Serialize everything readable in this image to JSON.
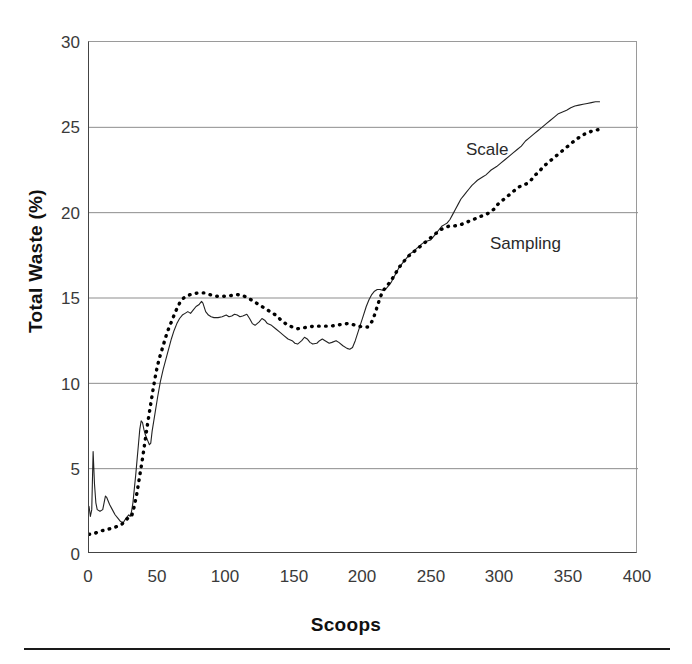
{
  "figure": {
    "background_color": "#ffffff",
    "frame_color": "#444444",
    "gridline_color": "#8d8d8d",
    "scale_series_color": "#222222",
    "sampling_series_color": "#000000"
  },
  "annotations": {
    "scale_label": "Scale",
    "sampling_label": "Sampling"
  },
  "axis": {
    "y_title": "Total Waste (%)",
    "x_title": "Scoops",
    "y_ticks": [
      "0",
      "5",
      "10",
      "15",
      "20",
      "25",
      "30"
    ],
    "x_ticks": [
      "0",
      "50",
      "100",
      "150",
      "200",
      "250",
      "300",
      "350",
      "400"
    ]
  },
  "chart_data": {
    "type": "line",
    "title": "",
    "subtitle": "",
    "xlabel": "Scoops",
    "ylabel": "Total Waste (%)",
    "xlim": [
      0,
      400
    ],
    "ylim": [
      0,
      30
    ],
    "x_ticks": [
      0,
      50,
      100,
      150,
      200,
      250,
      300,
      350,
      400
    ],
    "y_ticks": [
      0,
      5,
      10,
      15,
      20,
      25,
      30
    ],
    "grid": "horizontal",
    "legend_position": "inline-annotations",
    "series": [
      {
        "name": "Scale",
        "style": "solid-thin",
        "color": "#222222",
        "annotation_at": {
          "x": 283,
          "y": 23.6
        },
        "points": [
          [
            0,
            2.8
          ],
          [
            1,
            2.2
          ],
          [
            2,
            2.6
          ],
          [
            3,
            6.0
          ],
          [
            4,
            4.1
          ],
          [
            5,
            3.0
          ],
          [
            6,
            2.6
          ],
          [
            8,
            2.5
          ],
          [
            10,
            2.6
          ],
          [
            12,
            3.4
          ],
          [
            13,
            3.3
          ],
          [
            15,
            2.9
          ],
          [
            17,
            2.6
          ],
          [
            19,
            2.3
          ],
          [
            21,
            2.1
          ],
          [
            23,
            1.9
          ],
          [
            25,
            1.85
          ],
          [
            27,
            2.1
          ],
          [
            29,
            2.3
          ],
          [
            30,
            2.2
          ],
          [
            31,
            2.5
          ],
          [
            32,
            3.0
          ],
          [
            33,
            3.8
          ],
          [
            34,
            4.6
          ],
          [
            35,
            5.5
          ],
          [
            36,
            6.4
          ],
          [
            37,
            7.3
          ],
          [
            38,
            7.8
          ],
          [
            39,
            7.7
          ],
          [
            40,
            7.3
          ],
          [
            41,
            7.0
          ],
          [
            42,
            6.8
          ],
          [
            43,
            6.6
          ],
          [
            44,
            6.4
          ],
          [
            45,
            6.5
          ],
          [
            46,
            7.2
          ],
          [
            48,
            8.2
          ],
          [
            50,
            9.2
          ],
          [
            52,
            10.1
          ],
          [
            54,
            10.8
          ],
          [
            56,
            11.4
          ],
          [
            58,
            12.0
          ],
          [
            60,
            12.6
          ],
          [
            62,
            13.1
          ],
          [
            64,
            13.5
          ],
          [
            66,
            13.8
          ],
          [
            68,
            14.0
          ],
          [
            70,
            14.1
          ],
          [
            72,
            14.2
          ],
          [
            74,
            14.1
          ],
          [
            76,
            14.3
          ],
          [
            78,
            14.5
          ],
          [
            80,
            14.6
          ],
          [
            82,
            14.8
          ],
          [
            83,
            14.7
          ],
          [
            85,
            14.2
          ],
          [
            87,
            14.0
          ],
          [
            89,
            13.9
          ],
          [
            91,
            13.85
          ],
          [
            94,
            13.85
          ],
          [
            97,
            13.9
          ],
          [
            100,
            14.0
          ],
          [
            102,
            13.9
          ],
          [
            104,
            13.95
          ],
          [
            106,
            14.05
          ],
          [
            108,
            14.0
          ],
          [
            110,
            13.9
          ],
          [
            112,
            13.95
          ],
          [
            115,
            14.05
          ],
          [
            117,
            13.8
          ],
          [
            119,
            13.5
          ],
          [
            121,
            13.4
          ],
          [
            124,
            13.6
          ],
          [
            126,
            13.8
          ],
          [
            128,
            13.7
          ],
          [
            130,
            13.5
          ],
          [
            133,
            13.4
          ],
          [
            136,
            13.2
          ],
          [
            139,
            13.0
          ],
          [
            142,
            12.8
          ],
          [
            145,
            12.6
          ],
          [
            148,
            12.5
          ],
          [
            150,
            12.35
          ],
          [
            152,
            12.3
          ],
          [
            155,
            12.5
          ],
          [
            157,
            12.7
          ],
          [
            159,
            12.6
          ],
          [
            161,
            12.4
          ],
          [
            163,
            12.3
          ],
          [
            166,
            12.35
          ],
          [
            168,
            12.5
          ],
          [
            170,
            12.6
          ],
          [
            172,
            12.5
          ],
          [
            175,
            12.35
          ],
          [
            177,
            12.4
          ],
          [
            180,
            12.5
          ],
          [
            182,
            12.4
          ],
          [
            185,
            12.2
          ],
          [
            188,
            12.05
          ],
          [
            190,
            12.0
          ],
          [
            192,
            12.1
          ],
          [
            194,
            12.5
          ],
          [
            196,
            13.0
          ],
          [
            198,
            13.5
          ],
          [
            200,
            14.0
          ],
          [
            202,
            14.5
          ],
          [
            204,
            14.9
          ],
          [
            206,
            15.2
          ],
          [
            208,
            15.4
          ],
          [
            210,
            15.5
          ],
          [
            212,
            15.5
          ],
          [
            214,
            15.45
          ],
          [
            216,
            15.5
          ],
          [
            218,
            15.7
          ],
          [
            220,
            15.9
          ],
          [
            222,
            16.2
          ],
          [
            224,
            16.5
          ],
          [
            226,
            16.8
          ],
          [
            228,
            17.0
          ],
          [
            230,
            17.2
          ],
          [
            232,
            17.4
          ],
          [
            234,
            17.6
          ],
          [
            236,
            17.7
          ],
          [
            238,
            17.85
          ],
          [
            240,
            18.0
          ],
          [
            243,
            18.2
          ],
          [
            245,
            18.3
          ],
          [
            247,
            18.35
          ],
          [
            249,
            18.4
          ],
          [
            251,
            18.6
          ],
          [
            253,
            18.8
          ],
          [
            255,
            19.0
          ],
          [
            257,
            19.2
          ],
          [
            259,
            19.3
          ],
          [
            261,
            19.4
          ],
          [
            263,
            19.6
          ],
          [
            265,
            19.9
          ],
          [
            267,
            20.2
          ],
          [
            269,
            20.5
          ],
          [
            271,
            20.8
          ],
          [
            273,
            21.0
          ],
          [
            275,
            21.2
          ],
          [
            277,
            21.4
          ],
          [
            279,
            21.6
          ],
          [
            281,
            21.75
          ],
          [
            283,
            21.9
          ],
          [
            285,
            22.0
          ],
          [
            287,
            22.1
          ],
          [
            289,
            22.2
          ],
          [
            291,
            22.35
          ],
          [
            293,
            22.5
          ],
          [
            295,
            22.6
          ],
          [
            297,
            22.7
          ],
          [
            300,
            22.9
          ],
          [
            303,
            23.1
          ],
          [
            306,
            23.3
          ],
          [
            309,
            23.5
          ],
          [
            312,
            23.7
          ],
          [
            315,
            23.9
          ],
          [
            318,
            24.2
          ],
          [
            321,
            24.4
          ],
          [
            324,
            24.6
          ],
          [
            327,
            24.8
          ],
          [
            330,
            25.0
          ],
          [
            333,
            25.2
          ],
          [
            336,
            25.4
          ],
          [
            339,
            25.6
          ],
          [
            342,
            25.8
          ],
          [
            345,
            25.9
          ],
          [
            348,
            26.0
          ],
          [
            351,
            26.15
          ],
          [
            354,
            26.25
          ],
          [
            357,
            26.3
          ],
          [
            360,
            26.35
          ],
          [
            363,
            26.4
          ],
          [
            366,
            26.45
          ],
          [
            369,
            26.5
          ],
          [
            372,
            26.5
          ]
        ]
      },
      {
        "name": "Sampling",
        "style": "dotted-thick",
        "color": "#000000",
        "annotation_at": {
          "x": 300,
          "y": 18.5
        },
        "points": [
          [
            0,
            1.15
          ],
          [
            4,
            1.2
          ],
          [
            8,
            1.35
          ],
          [
            12,
            1.4
          ],
          [
            16,
            1.5
          ],
          [
            20,
            1.6
          ],
          [
            24,
            1.75
          ],
          [
            27,
            2.0
          ],
          [
            29,
            2.15
          ],
          [
            31,
            2.2
          ],
          [
            33,
            2.8
          ],
          [
            35,
            3.6
          ],
          [
            37,
            4.6
          ],
          [
            39,
            5.6
          ],
          [
            41,
            6.7
          ],
          [
            43,
            7.8
          ],
          [
            45,
            8.8
          ],
          [
            47,
            9.8
          ],
          [
            49,
            10.7
          ],
          [
            51,
            11.4
          ],
          [
            54,
            12.2
          ],
          [
            57,
            13.0
          ],
          [
            60,
            13.6
          ],
          [
            63,
            14.2
          ],
          [
            66,
            14.7
          ],
          [
            69,
            15.0
          ],
          [
            72,
            15.15
          ],
          [
            76,
            15.25
          ],
          [
            80,
            15.3
          ],
          [
            84,
            15.3
          ],
          [
            88,
            15.2
          ],
          [
            92,
            15.1
          ],
          [
            96,
            15.1
          ],
          [
            100,
            15.1
          ],
          [
            104,
            15.15
          ],
          [
            108,
            15.2
          ],
          [
            112,
            15.15
          ],
          [
            116,
            15.0
          ],
          [
            120,
            14.8
          ],
          [
            124,
            14.6
          ],
          [
            128,
            14.4
          ],
          [
            132,
            14.2
          ],
          [
            136,
            14.0
          ],
          [
            140,
            13.7
          ],
          [
            144,
            13.45
          ],
          [
            148,
            13.3
          ],
          [
            152,
            13.2
          ],
          [
            156,
            13.25
          ],
          [
            160,
            13.3
          ],
          [
            164,
            13.35
          ],
          [
            168,
            13.35
          ],
          [
            172,
            13.35
          ],
          [
            176,
            13.35
          ],
          [
            180,
            13.4
          ],
          [
            184,
            13.45
          ],
          [
            188,
            13.5
          ],
          [
            192,
            13.45
          ],
          [
            196,
            13.35
          ],
          [
            200,
            13.3
          ],
          [
            203,
            13.3
          ],
          [
            206,
            13.6
          ],
          [
            208,
            14.0
          ],
          [
            210,
            14.5
          ],
          [
            212,
            15.0
          ],
          [
            214,
            15.4
          ],
          [
            216,
            15.6
          ],
          [
            218,
            15.8
          ],
          [
            220,
            16.0
          ],
          [
            223,
            16.4
          ],
          [
            226,
            16.8
          ],
          [
            229,
            17.1
          ],
          [
            232,
            17.4
          ],
          [
            235,
            17.6
          ],
          [
            238,
            17.8
          ],
          [
            241,
            18.0
          ],
          [
            244,
            18.2
          ],
          [
            247,
            18.4
          ],
          [
            250,
            18.6
          ],
          [
            253,
            18.8
          ],
          [
            256,
            19.0
          ],
          [
            259,
            19.1
          ],
          [
            262,
            19.2
          ],
          [
            265,
            19.2
          ],
          [
            268,
            19.25
          ],
          [
            271,
            19.3
          ],
          [
            274,
            19.4
          ],
          [
            277,
            19.5
          ],
          [
            280,
            19.6
          ],
          [
            283,
            19.7
          ],
          [
            286,
            19.8
          ],
          [
            289,
            19.9
          ],
          [
            292,
            20.0
          ],
          [
            295,
            20.2
          ],
          [
            298,
            20.5
          ],
          [
            301,
            20.7
          ],
          [
            304,
            20.9
          ],
          [
            307,
            21.1
          ],
          [
            310,
            21.3
          ],
          [
            313,
            21.5
          ],
          [
            316,
            21.6
          ],
          [
            319,
            21.7
          ],
          [
            322,
            21.9
          ],
          [
            325,
            22.2
          ],
          [
            328,
            22.4
          ],
          [
            331,
            22.7
          ],
          [
            334,
            22.9
          ],
          [
            337,
            23.1
          ],
          [
            340,
            23.3
          ],
          [
            343,
            23.5
          ],
          [
            346,
            23.7
          ],
          [
            349,
            23.9
          ],
          [
            352,
            24.1
          ],
          [
            355,
            24.3
          ],
          [
            358,
            24.45
          ],
          [
            361,
            24.6
          ],
          [
            364,
            24.7
          ],
          [
            367,
            24.8
          ],
          [
            370,
            24.85
          ],
          [
            374,
            24.9
          ]
        ]
      }
    ]
  }
}
